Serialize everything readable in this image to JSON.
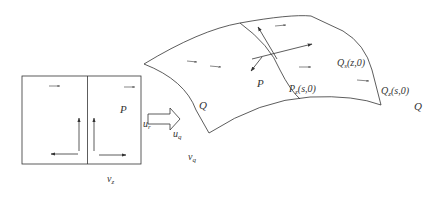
{
  "diagram": {
    "type": "mapping-illustration",
    "colors": {
      "stroke": "#333333",
      "background": "#ffffff"
    },
    "left_panel": {
      "labels": {
        "P": {
          "base": "P",
          "sub": ""
        },
        "u_r": {
          "base": "u",
          "sub": "r"
        },
        "u_q": {
          "base": "u",
          "sub": "q"
        },
        "v_z": {
          "base": "v",
          "sub": "z"
        },
        "v_q": {
          "base": "v",
          "sub": "q"
        }
      }
    },
    "surface": {
      "labels": {
        "P": {
          "base": "P",
          "sub": ""
        },
        "Q_left": {
          "base": "Q",
          "sub": ""
        },
        "P_s0": {
          "base": "P",
          "sub": "z",
          "suffix": "(s,0)"
        },
        "Q_z0": {
          "base": "Q",
          "sub": "s",
          "suffix": "(z,0)"
        },
        "Q_s0": {
          "base": "Q",
          "sub": "z",
          "suffix": "(s,0)"
        },
        "Q_right": {
          "base": "Q",
          "sub": ""
        }
      }
    }
  }
}
